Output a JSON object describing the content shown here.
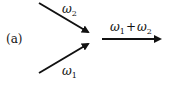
{
  "panel_label": "(a)",
  "inputs": [
    {
      "symbol": "ω",
      "subscript": "2",
      "position": "top"
    },
    {
      "symbol": "ω",
      "subscript": "1",
      "position": "bottom"
    }
  ],
  "output": {
    "symbol1": "ω",
    "sub1": "1",
    "plus": "+",
    "symbol2": "ω",
    "sub2": "2"
  },
  "colors": {
    "stroke": "#111111"
  }
}
